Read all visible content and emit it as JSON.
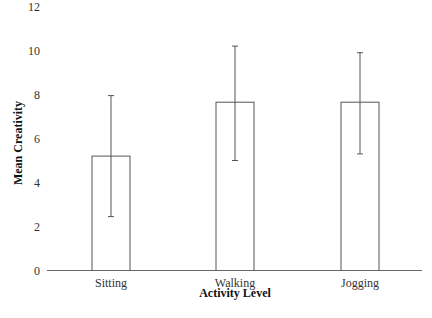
{
  "chart_data": {
    "type": "bar",
    "title": "",
    "xlabel": "Activity Level",
    "ylabel": "Mean Creativity",
    "categories": [
      "Sitting",
      "Walking",
      "Jogging"
    ],
    "values": [
      5.2,
      7.65,
      7.65
    ],
    "error_bars": {
      "upper": [
        7.95,
        10.2,
        9.9
      ],
      "lower": [
        2.45,
        5.0,
        5.3
      ]
    },
    "ylim": [
      0,
      12
    ],
    "yticks": [
      0,
      2,
      4,
      6,
      8,
      10,
      12
    ],
    "grid": false,
    "legend": null,
    "bar_fill": "#ffffff",
    "bar_stroke": "#555555"
  }
}
